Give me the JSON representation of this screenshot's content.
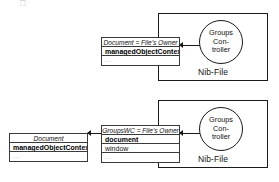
{
  "diagram": {
    "artifact_glyph": "□",
    "nib_top": {
      "label": "Nib-File",
      "controller": {
        "line1": "Groups",
        "line2": "Con-",
        "line3": "troller"
      },
      "object_box": {
        "title": "Document = File's Owner",
        "rows": [
          {
            "text": "managedObjectContext",
            "style": "bold"
          },
          {
            "text": "...",
            "style": "ellipsis"
          }
        ]
      }
    },
    "nib_bottom": {
      "label": "Nib-File",
      "controller": {
        "line1": "Groups",
        "line2": "Con-",
        "line3": "troller"
      },
      "object_box": {
        "title": "GroupsWC = File's Owner",
        "rows": [
          {
            "text": "document",
            "style": "bold"
          },
          {
            "text": "window",
            "style": "plain"
          },
          {
            "text": "...",
            "style": "ellipsis"
          }
        ]
      }
    },
    "document_box": {
      "title": "Document",
      "rows": [
        {
          "text": "managedObjectContext",
          "style": "bold"
        },
        {
          "text": "...",
          "style": "ellipsis"
        }
      ]
    },
    "colors": {
      "stroke": "#1a1a1a",
      "box_stroke": "#3a3a3a",
      "background": "#ffffff",
      "muted_text": "#9a9a9a"
    }
  }
}
